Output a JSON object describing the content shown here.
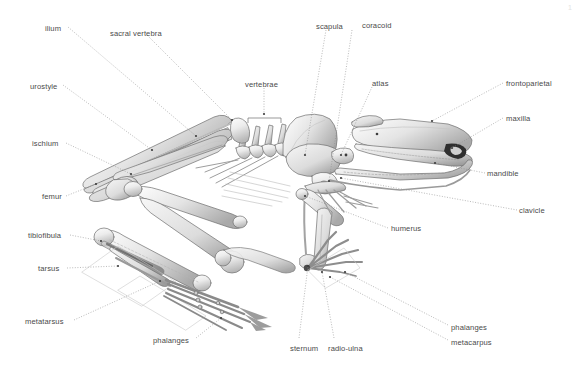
{
  "figure": {
    "background_color": "#ffffff",
    "bone_color": "#e8e8e8",
    "outline_color": "#6b6b6b",
    "leader_color": "#8c8c8c",
    "label_color": "#4a4a4a",
    "page_number": "1"
  },
  "labels": [
    {
      "id": "ilium",
      "text": "ilium",
      "x": 45,
      "y": 24,
      "align": "left"
    },
    {
      "id": "sacral-vertebra",
      "text": "sacral vertebra",
      "x": 110,
      "y": 29,
      "align": "left"
    },
    {
      "id": "scapula",
      "text": "scapula",
      "x": 316,
      "y": 22,
      "align": "left"
    },
    {
      "id": "coracoid",
      "text": "coracoid",
      "x": 362,
      "y": 21,
      "align": "left"
    },
    {
      "id": "urostyle",
      "text": "urostyle",
      "x": 30,
      "y": 82,
      "align": "left"
    },
    {
      "id": "vertebrae",
      "text": "vertebrae",
      "x": 245,
      "y": 80,
      "align": "left"
    },
    {
      "id": "atlas",
      "text": "atlas",
      "x": 372,
      "y": 79,
      "align": "left"
    },
    {
      "id": "frontoparietal",
      "text": "frontoparietal",
      "x": 506,
      "y": 79,
      "align": "left"
    },
    {
      "id": "maxilla",
      "text": "maxilla",
      "x": 506,
      "y": 114,
      "align": "left"
    },
    {
      "id": "ischium",
      "text": "ischium",
      "x": 32,
      "y": 139,
      "align": "left"
    },
    {
      "id": "mandible",
      "text": "mandible",
      "x": 487,
      "y": 169,
      "align": "left"
    },
    {
      "id": "femur",
      "text": "femur",
      "x": 42,
      "y": 192,
      "align": "left"
    },
    {
      "id": "clavicle",
      "text": "clavicle",
      "x": 519,
      "y": 206,
      "align": "left"
    },
    {
      "id": "humerus",
      "text": "humerus",
      "x": 391,
      "y": 224,
      "align": "left"
    },
    {
      "id": "tibiofibula",
      "text": "tibiofibula",
      "x": 28,
      "y": 231,
      "align": "left"
    },
    {
      "id": "tarsus",
      "text": "tarsus",
      "x": 38,
      "y": 264,
      "align": "left"
    },
    {
      "id": "metatarsus",
      "text": "metatarsus",
      "x": 25,
      "y": 317,
      "align": "left"
    },
    {
      "id": "phalanges-hind",
      "text": "phalanges",
      "x": 153,
      "y": 336,
      "align": "left"
    },
    {
      "id": "phalanges-fore",
      "text": "phalanges",
      "x": 451,
      "y": 323,
      "align": "left"
    },
    {
      "id": "metacarpus",
      "text": "metacarpus",
      "x": 451,
      "y": 338,
      "align": "left"
    },
    {
      "id": "sternum",
      "text": "sternum",
      "x": 290,
      "y": 344,
      "align": "left"
    },
    {
      "id": "radio-ulna",
      "text": "radio-ulna",
      "x": 328,
      "y": 344,
      "align": "left"
    }
  ],
  "leader_lines": [
    {
      "id": "leader-ilium",
      "points": "68,27 196,136"
    },
    {
      "id": "leader-sacral-vertebra",
      "points": "147,35 232,120"
    },
    {
      "id": "leader-scapula",
      "points": "326,30 305,155"
    },
    {
      "id": "leader-coracoid",
      "points": "352,30 329,181"
    },
    {
      "id": "leader-urostyle",
      "points": "63,85 152,150"
    },
    {
      "id": "leader-vertebrae",
      "points": "264,88 264,114"
    },
    {
      "id": "leader-atlas",
      "points": "372,87 341,155"
    },
    {
      "id": "leader-frontoparietal",
      "points": "503,83 432,121"
    },
    {
      "id": "leader-maxilla",
      "points": "503,118 452,148"
    },
    {
      "id": "leader-ischium",
      "points": "66,143 131,174"
    },
    {
      "id": "leader-mandible",
      "points": "485,173 435,163"
    },
    {
      "id": "leader-femur",
      "points": "66,196 96,184"
    },
    {
      "id": "leader-clavicle",
      "points": "517,210 341,178"
    },
    {
      "id": "leader-humerus",
      "points": "388,228 305,196"
    },
    {
      "id": "leader-tibiofibula",
      "points": "70,235 101,241"
    },
    {
      "id": "leader-tarsus",
      "points": "67,268 118,266"
    },
    {
      "id": "leader-metatarsus",
      "points": "74,320 160,281"
    },
    {
      "id": "leader-phalanges-hind",
      "points": "196,338 221,318"
    },
    {
      "id": "leader-phalanges-fore",
      "points": "448,325 345,272"
    },
    {
      "id": "leader-metacarpus",
      "points": "448,340 330,277"
    },
    {
      "id": "leader-sternum",
      "points": "299,338 308,266"
    },
    {
      "id": "leader-radio-ulna",
      "points": "334,338 322,272"
    }
  ],
  "bracket": {
    "id": "vertebrae-bracket",
    "x1": 248,
    "x2": 281,
    "y": 118,
    "tick": 5
  }
}
